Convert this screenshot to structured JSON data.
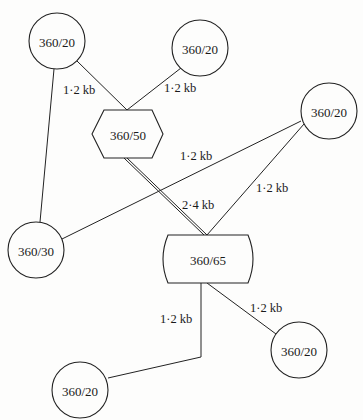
{
  "diagram": {
    "type": "network-topology",
    "nodes": [
      {
        "id": "n1",
        "label": "360/20",
        "shape": "circle",
        "cx": 57,
        "cy": 41,
        "r": 28
      },
      {
        "id": "n2",
        "label": "360/20",
        "shape": "circle",
        "cx": 200,
        "cy": 48,
        "r": 28
      },
      {
        "id": "n3",
        "label": "360/50",
        "shape": "hexagon",
        "cx": 128,
        "cy": 134
      },
      {
        "id": "n4",
        "label": "360/20",
        "shape": "circle",
        "cx": 329,
        "cy": 111,
        "r": 28
      },
      {
        "id": "n5",
        "label": "360/30",
        "shape": "circle",
        "cx": 36,
        "cy": 250,
        "r": 28
      },
      {
        "id": "n6",
        "label": "360/65",
        "shape": "curved-box",
        "cx": 208,
        "cy": 259
      },
      {
        "id": "n7",
        "label": "360/20",
        "shape": "circle",
        "cx": 299,
        "cy": 350,
        "r": 28
      },
      {
        "id": "n8",
        "label": "360/20",
        "shape": "circle",
        "cx": 80,
        "cy": 390,
        "r": 28
      }
    ],
    "edges": [
      {
        "from": "n1",
        "to": "n3",
        "label": "1·2 kb",
        "style": "single"
      },
      {
        "from": "n2",
        "to": "n3",
        "label": "1·2 kb",
        "style": "single"
      },
      {
        "from": "n1",
        "to": "n5",
        "label": "",
        "style": "single"
      },
      {
        "from": "n4",
        "to": "n5",
        "label": "1·2 kb",
        "style": "single"
      },
      {
        "from": "n4",
        "to": "n6",
        "label": "1·2 kb",
        "style": "single"
      },
      {
        "from": "n3",
        "to": "n6",
        "label": "2·4 kb",
        "style": "double"
      },
      {
        "from": "n6",
        "to": "n7",
        "label": "1·2 kb",
        "style": "single"
      },
      {
        "from": "n6",
        "to": "n8",
        "label": "1·2 kb",
        "style": "single"
      }
    ],
    "labels": {
      "n1": "360/20",
      "n2": "360/20",
      "n3": "360/50",
      "n4": "360/20",
      "n5": "360/30",
      "n6": "360/65",
      "n7": "360/20",
      "n8": "360/20",
      "e_n1_n3": "1·2 kb",
      "e_n2_n3": "1·2 kb",
      "e_n4_n5": "1·2 kb",
      "e_n4_n6": "1·2 kb",
      "e_n3_n6": "2·4 kb",
      "e_n6_n7": "1·2 kb",
      "e_n6_n8": "1·2 kb"
    }
  }
}
